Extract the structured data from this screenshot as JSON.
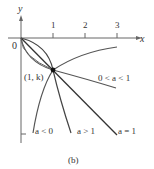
{
  "figure": {
    "caption": "(b)",
    "axes": {
      "x_label": "x",
      "y_label": "y",
      "origin_label": "0",
      "x_ticks": [
        "1",
        "2",
        "3"
      ]
    },
    "point_label": "(1, k)",
    "curves": [
      {
        "id": "a-between-0-1",
        "label": "0 < a < 1"
      },
      {
        "id": "a-less-0",
        "label": "a < 0"
      },
      {
        "id": "a-greater-1",
        "label": "a > 1"
      },
      {
        "id": "a-equals-1",
        "label": "a = 1"
      }
    ]
  }
}
